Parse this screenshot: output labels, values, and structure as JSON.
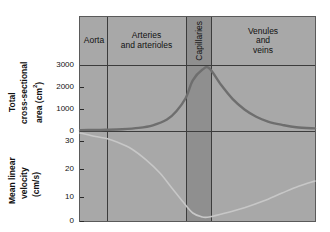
{
  "figure": {
    "background": "#a8a8a8",
    "band_color": "#8f8f8f",
    "line_color": "#3c3c3c",
    "area_curve_color": "#6e6e6e",
    "velocity_curve_color": "#c9c9c9"
  },
  "headers": [
    {
      "label": "Aorta",
      "orientation": "horizontal"
    },
    {
      "label": "Arteries\nand arterioles",
      "line1": "Arteries",
      "line2": "and arterioles",
      "orientation": "horizontal"
    },
    {
      "label": "Capillaries",
      "orientation": "vertical"
    },
    {
      "label": "Venules\nand\nveins",
      "line1": "Venules",
      "line2": "and",
      "line3": "veins",
      "orientation": "horizontal"
    }
  ],
  "axes": {
    "top": {
      "title_line1": "Total",
      "title_line2": "cross-sectional",
      "title_line3": "area (cm",
      "title_sup": "2",
      "title_line3_end": ")",
      "ticks": [
        "3000",
        "2000",
        "1000",
        "0"
      ],
      "tick_values": [
        3000,
        2000,
        1000,
        0
      ],
      "ylim": [
        0,
        3000
      ]
    },
    "bottom": {
      "title_line1": "Mean linear",
      "title_line2": "velocity",
      "title_line3": "(cm/s)",
      "ticks": [
        "30",
        "20",
        "10",
        "0"
      ],
      "tick_values": [
        30,
        20,
        10,
        0
      ],
      "ylim": [
        0,
        35
      ]
    }
  },
  "chart_data": {
    "type": "line",
    "title": "",
    "xlabel": "",
    "ylabel": "Total cross-sectional area (cm^2) / Mean linear velocity (cm/s)",
    "grid": false,
    "legend": "none",
    "categories": [
      "Aorta",
      "Arteries and arterioles",
      "Capillaries",
      "Venules and veins"
    ],
    "category_bounds_pct": [
      [
        0,
        11.4
      ],
      [
        11.4,
        44.7
      ],
      [
        44.7,
        55.3
      ],
      [
        55.3,
        100
      ]
    ],
    "series": [
      {
        "name": "Total cross-sectional area",
        "unit": "cm^2",
        "ylim": [
          0,
          3000
        ],
        "axis": "top",
        "x": [
          0,
          6,
          11,
          18,
          25,
          31,
          37,
          41,
          45,
          48,
          52,
          55,
          60,
          65,
          70,
          75,
          80,
          86,
          92,
          100
        ],
        "values": [
          40,
          45,
          55,
          80,
          140,
          260,
          520,
          900,
          1500,
          2300,
          2780,
          2850,
          2100,
          1450,
          980,
          650,
          430,
          280,
          170,
          120
        ]
      },
      {
        "name": "Mean linear velocity",
        "unit": "cm/s",
        "ylim": [
          0,
          35
        ],
        "axis": "bottom",
        "x": [
          0,
          5,
          11,
          16,
          22,
          28,
          34,
          39,
          44,
          48,
          52,
          55,
          62,
          70,
          78,
          86,
          93,
          100
        ],
        "values": [
          33,
          32,
          31,
          29.5,
          27,
          23,
          18,
          12.5,
          7,
          3,
          1.5,
          1.5,
          3,
          5,
          7.5,
          10.5,
          13,
          15
        ]
      }
    ]
  }
}
